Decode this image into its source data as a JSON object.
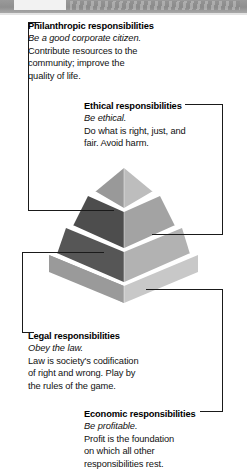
{
  "figure": {
    "type": "pyramid-diagram",
    "name": "Pyramid of Corporate Social Responsibility",
    "tier_count": 4,
    "colors": {
      "tier1_left": "#999999",
      "tier1_right": "#bdbdbd",
      "tier2_left": "#4d4d4d",
      "tier2_right": "#a3a3a3",
      "tier3_left": "#565656",
      "tier3_right": "#b2b2b2",
      "tier4_left": "#9a9a9a",
      "tier4_right": "#c8c8c8",
      "leader_line": "#1a1a1a",
      "header_band": "#939393",
      "page_background": "#ffffff"
    }
  },
  "header": {
    "tab_label": "",
    "band_label": ""
  },
  "callouts": [
    {
      "key": "philanthropic",
      "title": "Philanthropic responsibilities",
      "subtitle": "Be a good corporate citizen.",
      "body": [
        "Contribute resources to the",
        "community; improve the",
        "quality of life."
      ],
      "tier": 1,
      "bracket_side": "left"
    },
    {
      "key": "ethical",
      "title": "Ethical responsibilities",
      "subtitle": "Be ethical.",
      "body": [
        "Do what is right, just, and",
        "fair. Avoid harm."
      ],
      "tier": 2,
      "bracket_side": "right"
    },
    {
      "key": "legal",
      "title": "Legal responsibilities",
      "subtitle": "Obey the law.",
      "body": [
        "Law is society's codification",
        "of right and wrong. Play by",
        "the rules of the game."
      ],
      "tier": 3,
      "bracket_side": "left"
    },
    {
      "key": "economic",
      "title": "Economic responsibilities",
      "subtitle": "Be profitable.",
      "body": [
        "Profit is the foundation",
        "on which all other",
        "responsibilities rest."
      ],
      "tier": 4,
      "bracket_side": "right"
    }
  ]
}
